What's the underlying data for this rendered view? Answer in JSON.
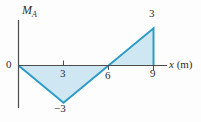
{
  "chart_data": {
    "type": "area",
    "title": "",
    "xlabel": "x (m)",
    "xlabel_var": "x",
    "xlabel_unit": "(m)",
    "ylabel": "M_A",
    "ylabel_main": "M",
    "ylabel_sub": "A",
    "x": [
      0,
      3,
      6,
      9,
      9
    ],
    "y": [
      0,
      -3,
      0,
      3,
      0
    ],
    "x_ticks": [
      3,
      6,
      9
    ],
    "x_tick_labels": [
      "3",
      "6",
      "9"
    ],
    "origin_label": "0",
    "point_labels": [
      {
        "x": 3,
        "y": -3,
        "label": "−3",
        "position": "below"
      },
      {
        "x": 9,
        "y": 3,
        "label": "3",
        "position": "above"
      }
    ],
    "xlim": [
      0,
      10.5
    ],
    "ylim": [
      -3.5,
      3.5
    ],
    "grid": false,
    "legend": false,
    "fill_color": "#cfe6f3",
    "stroke_color": "#2d9bc7",
    "axis_color": "#4d4d4d",
    "background_color": "#fdfdfd"
  }
}
